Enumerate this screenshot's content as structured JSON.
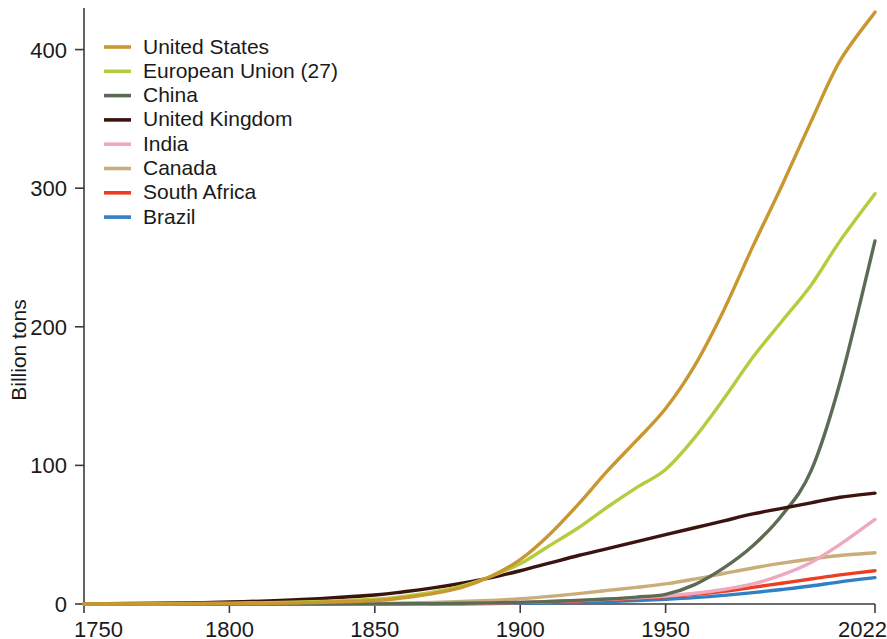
{
  "chart_data": {
    "type": "line",
    "title": "",
    "subtitle": "",
    "xlabel": "",
    "ylabel": "Billion tons",
    "xlim": [
      1750,
      2022
    ],
    "ylim": [
      0,
      430
    ],
    "grid": false,
    "legend_position": "top-left",
    "x_ticks": [
      "1750",
      "1800",
      "1850",
      "1900",
      "1950",
      "2022"
    ],
    "x_tick_values": [
      1750,
      1800,
      1850,
      1900,
      1950,
      2022
    ],
    "y_ticks": [
      "0",
      "100",
      "200",
      "300",
      "400"
    ],
    "y_tick_values": [
      0,
      100,
      200,
      300,
      400
    ],
    "x": [
      1750,
      1775,
      1800,
      1825,
      1850,
      1860,
      1870,
      1880,
      1890,
      1900,
      1910,
      1920,
      1930,
      1940,
      1950,
      1960,
      1970,
      1980,
      1990,
      2000,
      2010,
      2022
    ],
    "series": [
      {
        "name": "United States",
        "color": "#c8972f",
        "values": [
          0,
          0.1,
          0.3,
          0.8,
          2.5,
          4.5,
          7.5,
          12,
          20,
          32,
          50,
          72,
          96,
          118,
          141,
          172,
          212,
          258,
          302,
          348,
          392,
          427
        ],
        "end_value": 427
      },
      {
        "name": "European Union (27)",
        "color": "#b5cc3e",
        "values": [
          0,
          0.2,
          0.6,
          1.5,
          3.5,
          5.5,
          8.5,
          13,
          20,
          29,
          42,
          55,
          70,
          84,
          97,
          120,
          148,
          178,
          204,
          230,
          262,
          296
        ],
        "end_value": 296
      },
      {
        "name": "China",
        "color": "#5b6b54",
        "values": [
          0,
          0,
          0,
          0,
          0.1,
          0.2,
          0.3,
          0.5,
          0.8,
          1.2,
          1.8,
          2.6,
          3.6,
          5,
          7,
          14,
          26,
          42,
          64,
          96,
          160,
          262
        ],
        "end_value": 262
      },
      {
        "name": "United Kingdom",
        "color": "#3b1410",
        "values": [
          0.1,
          0.5,
          1.4,
          3.2,
          6.5,
          8.8,
          11.6,
          15,
          19,
          24,
          29.5,
          35,
          40,
          45,
          50,
          55,
          60,
          65,
          69,
          73,
          77,
          80
        ],
        "end_value": 80
      },
      {
        "name": "India",
        "color": "#f0a8c0",
        "values": [
          0,
          0,
          0,
          0,
          0.1,
          0.15,
          0.3,
          0.5,
          0.8,
          1.2,
          1.8,
          2.5,
          3.4,
          4.5,
          5.8,
          7.8,
          10.5,
          14.5,
          21,
          30,
          43,
          61
        ],
        "end_value": 61
      },
      {
        "name": "Canada",
        "color": "#c9ae7a",
        "values": [
          0,
          0,
          0.05,
          0.15,
          0.4,
          0.7,
          1.1,
          1.8,
          2.6,
          3.8,
          5.5,
          7.5,
          9.8,
          12,
          14.5,
          18,
          22,
          26,
          29.5,
          32.5,
          35,
          37
        ],
        "end_value": 37
      },
      {
        "name": "South Africa",
        "color": "#ec3f22",
        "values": [
          0,
          0,
          0,
          0,
          0.05,
          0.1,
          0.2,
          0.35,
          0.6,
          1,
          1.5,
          2.2,
          3,
          4,
          5.2,
          7,
          9.2,
          12,
          15,
          18,
          21,
          24
        ],
        "end_value": 24
      },
      {
        "name": "Brazil",
        "color": "#2f80c4",
        "values": [
          0,
          0,
          0,
          0,
          0.05,
          0.08,
          0.12,
          0.2,
          0.3,
          0.5,
          0.8,
          1.2,
          1.8,
          2.5,
          3.4,
          4.6,
          6.2,
          8.2,
          10.5,
          13,
          16,
          19
        ],
        "end_value": 19
      }
    ]
  },
  "legend": {
    "items": [
      {
        "label": "United States"
      },
      {
        "label": "European Union (27)"
      },
      {
        "label": "China"
      },
      {
        "label": "United Kingdom"
      },
      {
        "label": "India"
      },
      {
        "label": "Canada"
      },
      {
        "label": "South Africa"
      },
      {
        "label": "Brazil"
      }
    ]
  },
  "axes": {
    "y_title": "Billion tons"
  }
}
